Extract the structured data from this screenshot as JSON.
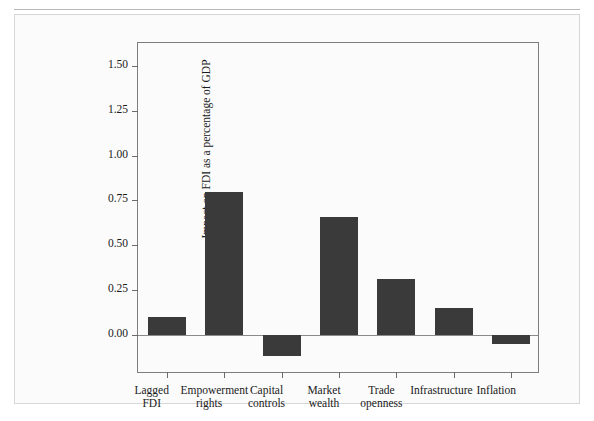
{
  "page": {
    "running_header": "",
    "background_color": "#ffffff",
    "figure_border_color": "#d7d7d7"
  },
  "chart_data": {
    "type": "bar",
    "title": "",
    "xlabel": "",
    "ylabel": "Impact on FDI as a percentage of GDP",
    "categories": [
      "Lagged FDI",
      "Empowerment rights",
      "Capital controls",
      "Market wealth",
      "Trade openness",
      "Infrastructure",
      "Inflation"
    ],
    "category_lines": [
      [
        "Lagged",
        "FDI"
      ],
      [
        "Empowerment",
        "rights"
      ],
      [
        "Capital",
        "controls"
      ],
      [
        "Market",
        "wealth"
      ],
      [
        "Trade",
        "openness"
      ],
      [
        "Infrastructure",
        ""
      ],
      [
        "Inflation",
        ""
      ]
    ],
    "values": [
      0.1,
      0.8,
      -0.12,
      0.66,
      0.31,
      0.15,
      -0.05
    ],
    "ytick_labels": [
      "0.00",
      "0.25",
      "0.50",
      "0.75",
      "1.00",
      "1.25",
      "1.50"
    ],
    "ytick_values": [
      0.0,
      0.25,
      0.5,
      0.75,
      1.0,
      1.25,
      1.5
    ],
    "ylim": [
      -0.22,
      1.63
    ],
    "grid": false,
    "legend": "none",
    "bar_color": "#3a3a3a",
    "axis_color": "#7d7d7d"
  }
}
